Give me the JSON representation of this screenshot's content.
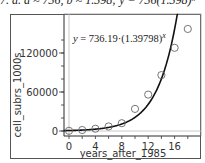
{
  "caption": "7. a. a ≈ 736, b ≈ 1.398; y = 736(1.398)ˣ",
  "chart_data": {
    "type": "scatter",
    "title": "",
    "xlabel": "years_after_1985",
    "ylabel": "cell_subrs_1000s",
    "x_ticks": [
      0,
      4,
      8,
      12,
      16
    ],
    "y_ticks": [
      0,
      60000,
      120000
    ],
    "xlim": [
      -1,
      20
    ],
    "ylim": [
      -2000,
      170000
    ],
    "grid": false,
    "legend": null,
    "series": [
      {
        "name": "data",
        "marker": "open-circle",
        "x": [
          0,
          2,
          4,
          6,
          8,
          10,
          12,
          14,
          16,
          18
        ],
        "y": [
          300,
          1500,
          3500,
          7000,
          12000,
          34000,
          56000,
          86000,
          128000,
          157000
        ]
      },
      {
        "name": "fit",
        "type": "line",
        "equation": "y = 736.19·(1.39798)^x",
        "a": 736.19,
        "b": 1.39798
      }
    ],
    "annotations": [
      {
        "text": "y = 736.19·(1.39798)",
        "superscript": "x"
      }
    ]
  }
}
